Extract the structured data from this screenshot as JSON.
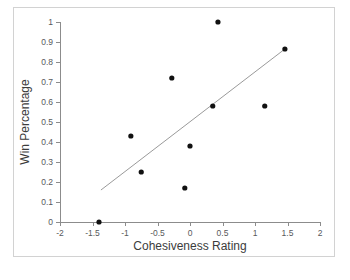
{
  "chart_data": {
    "type": "scatter",
    "title": "",
    "xlabel": "Cohesiveness Rating",
    "ylabel": "Win Percentage",
    "xlim": [
      -2,
      2
    ],
    "ylim": [
      0,
      1
    ],
    "grid": false,
    "legend": false,
    "legend_position": "none",
    "xticks": [
      -2,
      -1.5,
      -1,
      -0.5,
      0,
      0.5,
      1,
      1.5,
      2
    ],
    "xtick_labels": [
      "-2",
      "-1.5",
      "-1",
      "-0.5",
      "0",
      "0.5",
      "1",
      "1.5",
      "2"
    ],
    "yticks": [
      0,
      0.1,
      0.2,
      0.3,
      0.4,
      0.5,
      0.6,
      0.7,
      0.8,
      0.9,
      1
    ],
    "ytick_labels": [
      "0",
      "0.1",
      "0.2",
      "0.3",
      "0.4",
      "0.5",
      "0.6",
      "0.7",
      "0.8",
      "0.9",
      "1"
    ],
    "series": [
      {
        "name": "Teams",
        "type": "scatter",
        "marker": "circle",
        "color": "#111111",
        "points": [
          {
            "x": -1.4,
            "y": 0.0
          },
          {
            "x": -0.91,
            "y": 0.43
          },
          {
            "x": -0.75,
            "y": 0.25
          },
          {
            "x": -0.28,
            "y": 0.72
          },
          {
            "x": -0.08,
            "y": 0.17
          },
          {
            "x": 0.0,
            "y": 0.38
          },
          {
            "x": 0.35,
            "y": 0.58
          },
          {
            "x": 0.43,
            "y": 1.0
          },
          {
            "x": 1.15,
            "y": 0.58
          },
          {
            "x": 1.46,
            "y": 0.865
          }
        ]
      },
      {
        "name": "Trendline",
        "type": "line",
        "color": "#9a9a9a",
        "points": [
          {
            "x": -1.37,
            "y": 0.16
          },
          {
            "x": 1.46,
            "y": 0.865
          }
        ]
      }
    ],
    "colors": {
      "point": "#111111",
      "trendline": "#9a9a9a",
      "axis": "#8c8c8c",
      "tick_text": "#58595b",
      "axis_title": "#3c3c3c",
      "frame": "#d2d2d2",
      "background": "#ffffff"
    }
  }
}
